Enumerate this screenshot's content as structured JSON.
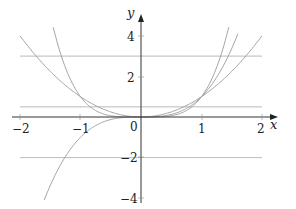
{
  "chart_data": {
    "type": "line",
    "title": "",
    "xlabel": "x",
    "ylabel": "y",
    "xlim": [
      -2,
      2
    ],
    "ylim": [
      -4,
      4.5
    ],
    "grid": false,
    "legend": null,
    "x_ticks": [
      "-2",
      "-1",
      "0",
      "1",
      "2"
    ],
    "y_ticks": [
      "4",
      "2",
      "-2",
      "-4"
    ],
    "series": [
      {
        "name": "y = x^2",
        "kind": "function",
        "expr": "x^2",
        "domain": [
          -2,
          2
        ]
      },
      {
        "name": "y = x^3",
        "kind": "function",
        "expr": "x^3",
        "domain": [
          -1.6,
          1.6
        ]
      },
      {
        "name": "y = x^4",
        "kind": "function",
        "expr": "x^4",
        "domain": [
          -1.45,
          1.45
        ]
      },
      {
        "name": "y = 3",
        "kind": "horizontal",
        "value": 3,
        "domain": [
          -2,
          2
        ]
      },
      {
        "name": "y = 0.5",
        "kind": "horizontal",
        "value": 0.5,
        "domain": [
          -2,
          2
        ]
      },
      {
        "name": "y = -2",
        "kind": "horizontal",
        "value": -2,
        "domain": [
          -2,
          2
        ]
      }
    ],
    "colors": {
      "axis": "#333333",
      "curve": "#999999",
      "hline": "#aaaaaa"
    }
  },
  "labels": {
    "x_axis": "x",
    "y_axis": "y",
    "xt_m2": "−2",
    "xt_m1": "−1",
    "xt_0": "0",
    "xt_1": "1",
    "xt_2": "2",
    "yt_4": "4",
    "yt_2": "2",
    "yt_m2": "−2",
    "yt_m4": "−4"
  }
}
